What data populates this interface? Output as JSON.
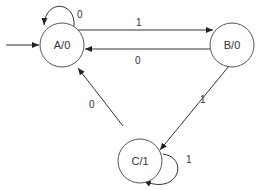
{
  "diagram": {
    "type": "moore-state-machine",
    "states": [
      {
        "id": "A",
        "label": "A/0",
        "cx": 62,
        "cy": 45,
        "r": 22,
        "initial": true
      },
      {
        "id": "B",
        "label": "B/0",
        "cx": 232,
        "cy": 45,
        "r": 22,
        "initial": false
      },
      {
        "id": "C",
        "label": "C/1",
        "cx": 140,
        "cy": 161,
        "r": 22,
        "initial": false
      }
    ],
    "transitions": [
      {
        "from": "A",
        "to": "A",
        "input": "0"
      },
      {
        "from": "A",
        "to": "B",
        "input": "1"
      },
      {
        "from": "B",
        "to": "A",
        "input": "0"
      },
      {
        "from": "B",
        "to": "C",
        "input": "1"
      },
      {
        "from": "C",
        "to": "A",
        "input": "0"
      },
      {
        "from": "C",
        "to": "C",
        "input": "1"
      }
    ],
    "labels": {
      "a_self": "0",
      "a_to_b": "1",
      "b_to_a": "0",
      "b_to_c": "1",
      "c_to_a": "0",
      "c_self": "1"
    }
  }
}
